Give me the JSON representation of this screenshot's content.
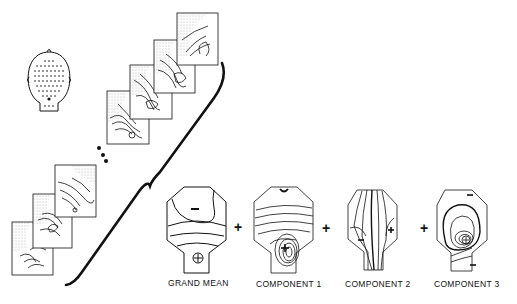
{
  "figure": {
    "head_diagram": {
      "label": "",
      "electrode_grid": "dot-array"
    },
    "map_sequence": {
      "ellipsis": "..."
    },
    "operators": [
      "+",
      "+",
      "+"
    ],
    "components": [
      {
        "label": "GRAND MEAN",
        "signs": [
          "-",
          "⊕"
        ]
      },
      {
        "label": "COMPONENT 1",
        "signs": [
          "-",
          "⊕"
        ]
      },
      {
        "label": "COMPONENT 2",
        "signs": [
          "-",
          "+"
        ]
      },
      {
        "label": "COMPONENT 3",
        "signs": [
          "-",
          "⊕",
          "-"
        ]
      }
    ]
  },
  "colors": {
    "ink": "#111111",
    "background": "#ffffff",
    "stipple": "#777777"
  }
}
